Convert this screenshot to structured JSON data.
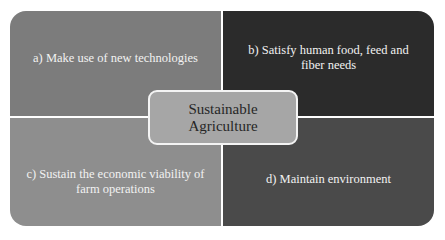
{
  "diagram": {
    "type": "quadrant-cycle",
    "center": {
      "label_line1": "Sustainable",
      "label_line2": "Agriculture",
      "color": "#a6a6a6"
    },
    "quadrants": [
      {
        "id": "a",
        "label": "a) Make use of new technologies",
        "color": "#7c7c7c"
      },
      {
        "id": "b",
        "label": "b) Satisfy human food, feed and fiber needs",
        "color": "#2b2b2b"
      },
      {
        "id": "c",
        "label": "c) Sustain the economic viability of farm operations",
        "color": "#8e8e8e"
      },
      {
        "id": "d",
        "label": "d) Maintain environment",
        "color": "#4a4a4a"
      }
    ]
  }
}
